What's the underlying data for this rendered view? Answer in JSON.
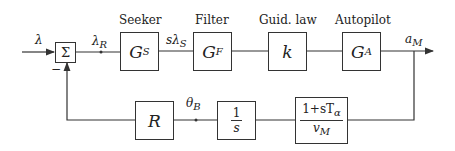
{
  "diagram": {
    "type": "feedback-block-diagram",
    "inputs": {
      "lambda": "λ",
      "lambda_R": "λ",
      "lambda_R_sub": "R"
    },
    "summing_junction": {
      "symbol": "Σ",
      "minus_sign": "−"
    },
    "blocks": [
      {
        "id": "seeker",
        "caption": "Seeker",
        "symbol": "G",
        "sub": "S"
      },
      {
        "id": "filter",
        "caption": "Filter",
        "symbol": "G",
        "sub": "F"
      },
      {
        "id": "guidance-law",
        "caption": "Guid. law",
        "symbol": "k",
        "sub": ""
      },
      {
        "id": "autopilot",
        "caption": "Autopilot",
        "symbol": "G",
        "sub": "A"
      }
    ],
    "signals": {
      "s_lambda_S": "sλ",
      "s_lambda_S_sub": "S",
      "a_M": "a",
      "a_M_sub": "M",
      "theta_B": "θ",
      "theta_B_sub": "B"
    },
    "feedback_blocks": [
      {
        "id": "R",
        "symbol": "R"
      },
      {
        "id": "integrator",
        "num": "1",
        "den": "s"
      },
      {
        "id": "aero",
        "num": "1+sT",
        "num_sub": "α",
        "den": "v",
        "den_sub": "M"
      }
    ]
  }
}
